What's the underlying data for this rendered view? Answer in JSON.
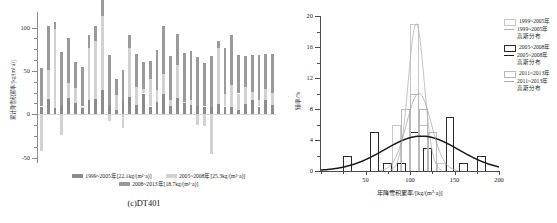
{
  "figure": {
    "caption": "(c)DT401"
  },
  "left_chart": {
    "ylabel": "累计降雪积累率/[kg/(m²·a)]",
    "y_ticks": [
      "100",
      "50",
      "0",
      "-50"
    ],
    "legend": [
      {
        "label": "1999~2005年[22.1kg/(m²·a)]",
        "color": "#8c8c8c",
        "swatch": "legend-swatch-1999-2005"
      },
      {
        "label": "2005~2008年[25.3kg/(m²·a)]",
        "color": "#d2d2d2",
        "swatch": "legend-swatch-2005-2008"
      },
      {
        "label": "2008~2013年[18.7kg/(m²·a)]",
        "color": "#9a9a9a",
        "swatch": "legend-swatch-2008-2013"
      }
    ]
  },
  "right_chart": {
    "xlabel": "年降雪积累率/[kg/(m²·a)]",
    "ylabel": "频率/%",
    "x_ticks": [
      "50",
      "100",
      "150",
      "200"
    ],
    "y_ticks": [
      "0",
      "4",
      "8",
      "12",
      "16",
      "20"
    ],
    "legend": [
      {
        "label": "1999~2005年",
        "type": "box",
        "color": "#c8c8c8"
      },
      {
        "label": "1999~2005年",
        "label2": "高斯分布",
        "type": "line",
        "color": "#b4b4b4"
      },
      {
        "label": "2005~2008年",
        "type": "box",
        "color": "#2b2b2b"
      },
      {
        "label": "2005~2008年",
        "label2": "高斯分布",
        "type": "line",
        "color": "#1a1a1a"
      },
      {
        "label": "2011~2013年",
        "type": "box",
        "color": "#b9b9b9"
      },
      {
        "label": "2011~2013年",
        "label2": "高斯分布",
        "type": "line",
        "color": "#a8a8a8"
      }
    ]
  },
  "chart_data": [
    {
      "type": "bar",
      "id": "cumulative-accumulation-bars",
      "title": "",
      "xlabel": "",
      "ylabel": "累计降雪积累率/[kg/(m²·a)]",
      "ylim": [
        -55,
        118
      ],
      "yticks": [
        -50,
        0,
        50,
        100
      ],
      "grid": false,
      "stacked": true,
      "legend_position": "below",
      "categories": [
        "1",
        "2",
        "3",
        "4",
        "5",
        "6",
        "7",
        "8",
        "9",
        "10",
        "11",
        "12",
        "13",
        "14",
        "15",
        "16",
        "17",
        "18",
        "19",
        "20",
        "21",
        "22",
        "23",
        "24",
        "25",
        "26",
        "27",
        "28",
        "29",
        "30",
        "31",
        "32",
        "33",
        "34",
        "35"
      ],
      "series": [
        {
          "name": "1999~2005年[22.1kg/(m²·a)]",
          "color": "#8c8c8c",
          "values": [
            9,
            18,
            7,
            11,
            19,
            13,
            8,
            16,
            18,
            28,
            11,
            5,
            16,
            20,
            11,
            24,
            9,
            14,
            23,
            10,
            19,
            13,
            11,
            10,
            9,
            9,
            12,
            9,
            8,
            5,
            12,
            16,
            9,
            17,
            11
          ]
        },
        {
          "name": "2005~2008年[25.3kg/(m²·a)]",
          "color": "#d2d2d2",
          "values": [
            -42,
            33,
            91,
            -24,
            17,
            17,
            1,
            61,
            67,
            85,
            -8,
            17,
            -16,
            56,
            21,
            5,
            32,
            14,
            24,
            6,
            38,
            1,
            6,
            -12,
            -14,
            -46,
            65,
            14,
            26,
            19,
            20,
            10,
            8,
            12,
            14
          ]
        },
        {
          "name": "2008~2013年[18.7kg/(m²·a)]",
          "color": "#9a9a9a",
          "values": [
            44,
            51,
            8,
            61,
            52,
            30,
            46,
            15,
            17,
            29,
            57,
            19,
            35,
            15,
            38,
            31,
            20,
            46,
            55,
            51,
            36,
            57,
            56,
            56,
            50,
            58,
            7,
            53,
            58,
            44,
            35,
            42,
            51,
            40,
            44
          ]
        }
      ]
    },
    {
      "type": "histogram",
      "id": "accumulation-rate-distribution",
      "title": "",
      "xlabel": "年降雪积累率/[kg/(m²·a)]",
      "ylabel": "频率/%",
      "xlim": [
        0,
        200
      ],
      "ylim": [
        0,
        20
      ],
      "xticks": [
        50,
        100,
        150,
        200
      ],
      "yticks": [
        0,
        4,
        8,
        12,
        16,
        20
      ],
      "grid": false,
      "legend_position": "top-right",
      "bin_width": 10,
      "series": [
        {
          "name": "1999~2005年",
          "type": "bars",
          "color": "#c8c8c8",
          "bins": [
            85,
            95,
            105,
            115,
            125,
            135
          ],
          "values": [
            6,
            8,
            19,
            6,
            5,
            1
          ]
        },
        {
          "name": "1999~2005年高斯分布",
          "type": "gaussian",
          "color": "#b4b4b4",
          "mean": 107,
          "sigma": 9,
          "peak": 19
        },
        {
          "name": "2005~2008年",
          "type": "bars",
          "color": "#2b2b2b",
          "bins": [
            30,
            60,
            75,
            90,
            105,
            120,
            145,
            160,
            180
          ],
          "values": [
            2,
            5,
            1,
            1,
            5,
            3,
            7,
            1,
            2
          ]
        },
        {
          "name": "2005~2008年高斯分布",
          "type": "gaussian",
          "color": "#1a1a1a",
          "mean": 113,
          "sigma": 42,
          "peak": 4.5
        },
        {
          "name": "2011~2013年",
          "type": "bars",
          "color": "#b9b9b9",
          "bins": [
            95,
            105,
            115,
            125
          ],
          "values": [
            8,
            10,
            8,
            5
          ]
        },
        {
          "name": "2011~2013年高斯分布",
          "type": "gaussian",
          "color": "#a8a8a8",
          "mean": 110,
          "sigma": 14,
          "peak": 10
        }
      ]
    }
  ]
}
